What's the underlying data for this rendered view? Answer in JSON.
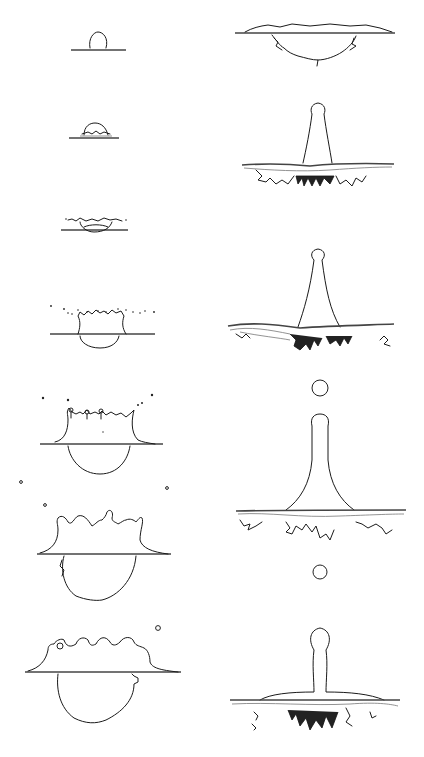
{
  "figure": {
    "left_column": {
      "frames": [
        {
          "index": 1,
          "stage": "drop-contact",
          "surface_y": 50
        },
        {
          "index": 2,
          "stage": "initial-spreading",
          "surface_y": 138
        },
        {
          "index": 3,
          "stage": "ejecta-sheet",
          "surface_y": 230
        },
        {
          "index": 4,
          "stage": "crown-with-spray",
          "surface_y": 334
        },
        {
          "index": 5,
          "stage": "crown-rim-droplets",
          "surface_y": 444
        },
        {
          "index": 6,
          "stage": "crown-expanding",
          "surface_y": 554
        },
        {
          "index": 7,
          "stage": "crown-collapsing",
          "surface_y": 672
        }
      ]
    },
    "right_column": {
      "frames": [
        {
          "index": 8,
          "stage": "crater-retracting",
          "surface_y": 33
        },
        {
          "index": 9,
          "stage": "central-jet-rising",
          "surface_y": 164
        },
        {
          "index": 10,
          "stage": "jet-with-vortex-ring",
          "surface_y": 328
        },
        {
          "index": 11,
          "stage": "jet-first-pinch-off",
          "surface_y": 511
        },
        {
          "index": 12,
          "stage": "jet-second-pinch-off",
          "surface_y": 700
        }
      ]
    },
    "colors": {
      "line": "#1a1a1a",
      "background": "#ffffff"
    }
  }
}
